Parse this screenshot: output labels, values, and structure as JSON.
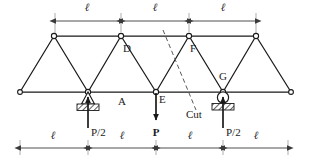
{
  "figure": {
    "background_color": "#ffffff",
    "line_color": "#1a1a1a",
    "dim_color": "#3a3a3a",
    "cut_color": "#555555"
  },
  "labels": {
    "node_d": "D",
    "node_f": "F",
    "node_g": "G",
    "node_e": "E",
    "panel_a": "A",
    "cut": "Cut",
    "load_p": "P",
    "reaction_left": "P/2",
    "reaction_right": "P/2"
  },
  "dimensions": {
    "top": {
      "segments": [
        "ℓ",
        "ℓ",
        "ℓ"
      ],
      "count": 3
    },
    "bottom": {
      "segments": [
        "ℓ",
        "ℓ",
        "ℓ",
        "ℓ"
      ],
      "count": 4
    },
    "symbol": "ℓ"
  },
  "geometry": {
    "top_chord_y": 36,
    "bottom_chord_y": 92,
    "bottom_left_x": 20,
    "bottom_right_x": 291,
    "top_nodes_x": [
      54,
      121,
      189,
      256
    ],
    "bottom_nodes_x": [
      20,
      88,
      156,
      223,
      291
    ],
    "panel_width": 67.5
  },
  "supports": {
    "left": {
      "type": "pin",
      "x": 88,
      "label": "P/2"
    },
    "right": {
      "type": "roller",
      "x": 223,
      "label": "P/2"
    }
  },
  "loads": [
    {
      "name": "applied-load-e",
      "label": "P",
      "x": 156,
      "direction": "down"
    },
    {
      "name": "reaction-left",
      "label": "P/2",
      "x": 88,
      "direction": "up"
    },
    {
      "name": "reaction-right",
      "label": "P/2",
      "x": 223,
      "direction": "up"
    }
  ],
  "cut_line": {
    "label": "Cut",
    "x1": 163,
    "y1": 30,
    "x2": 196,
    "y2": 110,
    "style": "dashed"
  }
}
